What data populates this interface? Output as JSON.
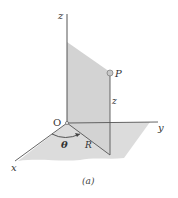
{
  "figure": {
    "caption": "(a)",
    "labels": {
      "z_axis": "z",
      "y_axis": "y",
      "x_axis": "x",
      "origin": "O",
      "point": "P",
      "height": "z",
      "angle": "θ",
      "radius": "R"
    },
    "colors": {
      "shade": "#d6d6d6",
      "line": "#4a4a4a",
      "point_fill": "#c8c8c8"
    }
  }
}
